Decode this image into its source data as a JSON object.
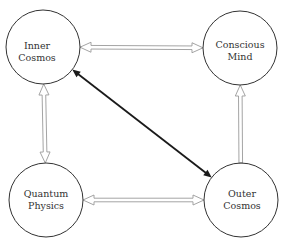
{
  "diagram": {
    "nodes": [
      {
        "id": "inner-cosmos",
        "line1": "Inner",
        "line2": "Cosmos",
        "cx": 43,
        "cy": 47,
        "r": 37,
        "label_dx": -6,
        "label_dy": 5
      },
      {
        "id": "conscious-mind",
        "line1": "Conscious",
        "line2": "Mind",
        "cx": 240,
        "cy": 48,
        "r": 37,
        "label_dx": 0,
        "label_dy": 3
      },
      {
        "id": "quantum-physics",
        "line1": "Quantum",
        "line2": "Physics",
        "cx": 46,
        "cy": 200,
        "r": 37,
        "label_dx": 0,
        "label_dy": 0
      },
      {
        "id": "outer-cosmos",
        "line1": "Outer",
        "line2": "Cosmos",
        "cx": 241,
        "cy": 200,
        "r": 37,
        "label_dx": 1,
        "label_dy": 0
      }
    ],
    "edges": [
      {
        "id": "inner-conscious",
        "from": "inner-cosmos",
        "to": "conscious-mind",
        "style": "hollow-double",
        "direction": "both"
      },
      {
        "id": "inner-quantum",
        "from": "inner-cosmos",
        "to": "quantum-physics",
        "style": "hollow-double",
        "direction": "both"
      },
      {
        "id": "outer-conscious",
        "from": "outer-cosmos",
        "to": "conscious-mind",
        "style": "hollow-double",
        "direction": "forward"
      },
      {
        "id": "quantum-outer",
        "from": "quantum-physics",
        "to": "outer-cosmos",
        "style": "hollow-double",
        "direction": "both"
      },
      {
        "id": "inner-outer",
        "from": "inner-cosmos",
        "to": "outer-cosmos",
        "style": "solid-bold",
        "direction": "both"
      }
    ],
    "colors": {
      "circle_stroke": "#333333",
      "hollow_arrow_stroke": "#9a9a9a",
      "solid_arrow": "#1a1a1a",
      "label": "#333333"
    }
  }
}
